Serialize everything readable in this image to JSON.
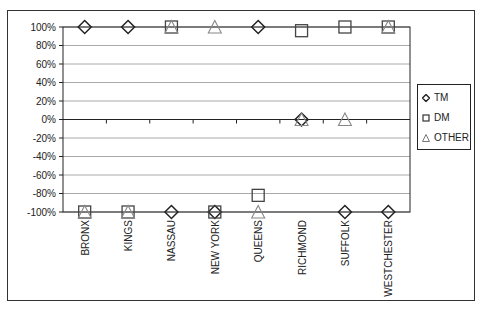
{
  "chart_data": {
    "type": "scatter",
    "title": "",
    "xlabel": "",
    "ylabel": "",
    "ylim": [
      -100,
      100
    ],
    "y_ticks": [
      "100%",
      "80%",
      "60%",
      "40%",
      "20%",
      "0%",
      "-20%",
      "-40%",
      "-60%",
      "-80%",
      "-100%"
    ],
    "grid": true,
    "legend_position": "right",
    "categories": [
      "BRONX",
      "KINGS",
      "NASSAU",
      "NEW YORK",
      "QUEENS",
      "RICHMOND",
      "SUFFOLK",
      "WESTCHESTER"
    ],
    "series": [
      {
        "name": "TM",
        "marker": "diamond",
        "values": [
          100,
          100,
          -100,
          -100,
          100,
          0,
          -100,
          -100
        ]
      },
      {
        "name": "DM",
        "marker": "square",
        "values": [
          -100,
          -100,
          100,
          -100,
          -82,
          96,
          100,
          100
        ]
      },
      {
        "name": "OTHER",
        "marker": "triangle",
        "values": [
          -100,
          -100,
          100,
          100,
          -100,
          0,
          0,
          100
        ]
      }
    ]
  },
  "legend": {
    "items": [
      {
        "label": "TM",
        "icon": "diamond-marker-icon"
      },
      {
        "label": "DM",
        "icon": "square-marker-icon"
      },
      {
        "label": "OTHER",
        "icon": "triangle-marker-icon"
      }
    ]
  },
  "colors": {
    "TM": "#222222",
    "DM": "#444444",
    "OTHER": "#888888",
    "gridline": "#aaaaaa",
    "axis": "#222222"
  }
}
